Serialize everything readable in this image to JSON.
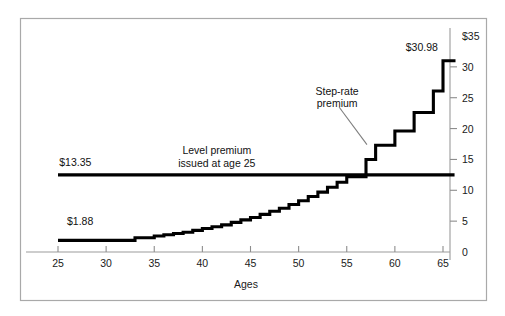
{
  "chart_data": {
    "type": "line",
    "title": "",
    "xlabel": "Ages",
    "ylabel": "",
    "xlim": [
      23.5,
      66.5
    ],
    "ylim": [
      0,
      35
    ],
    "xticks": [
      25,
      30,
      35,
      40,
      45,
      50,
      55,
      60,
      65
    ],
    "xtick_labels": [
      "25",
      "30",
      "35",
      "40",
      "45",
      "50",
      "55",
      "60",
      "65"
    ],
    "yticks": [
      0,
      5,
      10,
      15,
      20,
      25,
      30,
      35
    ],
    "ytick_labels": [
      "0",
      "5",
      "10",
      "15",
      "20",
      "25",
      "30",
      "$35"
    ],
    "grid": false,
    "legend": "none",
    "y_axis_position": "right",
    "series": [
      {
        "name": "Step-rate premium",
        "style": "step",
        "x": [
          25,
          30,
          33,
          35,
          36,
          37,
          38,
          39,
          40,
          41,
          42,
          43,
          44,
          45,
          46,
          47,
          48,
          49,
          50,
          51,
          52,
          53,
          54,
          55,
          56,
          57,
          58,
          59,
          60,
          61,
          62,
          63,
          64,
          65,
          66
        ],
        "values": [
          1.88,
          1.88,
          2.3,
          2.6,
          2.8,
          3.0,
          3.2,
          3.5,
          3.8,
          4.1,
          4.4,
          4.8,
          5.2,
          5.6,
          6.1,
          6.6,
          7.1,
          7.7,
          8.3,
          9.0,
          9.7,
          10.5,
          11.3,
          12.2,
          12.2,
          15.0,
          17.3,
          17.3,
          19.6,
          19.6,
          22.6,
          22.6,
          26.1,
          30.98,
          30.98
        ]
      },
      {
        "name": "Level premium issued at age 25",
        "style": "constant",
        "value": 12.5,
        "x_start": 25,
        "x_end": 66.2
      }
    ],
    "annotations": [
      {
        "id": "level-premium-label",
        "text_lines": [
          "Level premium",
          "issued at age 25"
        ],
        "x": 41.5,
        "y": 15.8
      },
      {
        "id": "step-rate-label",
        "text_lines": [
          "Step-rate",
          "premium"
        ],
        "x": 54.0,
        "y": 25.5
      },
      {
        "id": "level-premium-value",
        "text": "$13.35",
        "x": 26.8,
        "y": 14.0
      },
      {
        "id": "start-value",
        "text": "$1.88",
        "x": 27.3,
        "y": 4.3
      },
      {
        "id": "end-value",
        "text": "$30.98",
        "x": 62.8,
        "y": 32.6
      }
    ],
    "leader_lines": [
      {
        "id": "step-rate-leader",
        "x1": 54.2,
        "y1": 23.5,
        "x2": 57.1,
        "y2": 17.4
      }
    ]
  }
}
